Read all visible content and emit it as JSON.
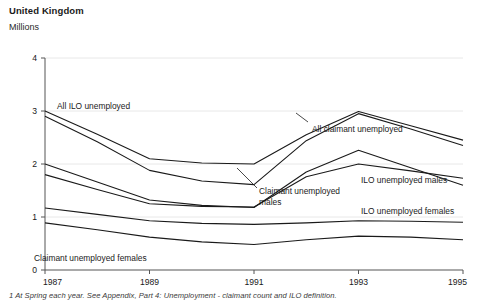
{
  "header": {
    "title": "United Kingdom",
    "unit": "Millions"
  },
  "footnote": "1 At Spring each year. See Appendix, Part 4: Unemployment - claimant count and ILO definition.",
  "axis": {
    "y_ticks": [
      "0",
      "1",
      "2",
      "3",
      "4"
    ],
    "x_ticks": [
      "1987",
      "1989",
      "1991",
      "1993",
      "1995"
    ]
  },
  "labels": {
    "all_ilo": "All ILO unemployed",
    "all_claimant": "All claimant unemployed",
    "ilo_males": "ILO unemployed males",
    "claimant_males_line1": "Claimant unemployed",
    "claimant_males_line2": "males",
    "ilo_females": "ILO unemployed females",
    "claimant_females": "Claimant unemployed females"
  },
  "colors": {
    "line": "#1a1a1a",
    "axis": "#555555",
    "grid": "#e8e8e8",
    "background": "#ffffff"
  },
  "chart_data": {
    "type": "line",
    "title": "United Kingdom",
    "subtitle": "Millions",
    "xlabel": "",
    "ylabel": "Millions",
    "x": [
      1987,
      1988,
      1989,
      1990,
      1991,
      1992,
      1993,
      1994,
      1995
    ],
    "xlim": [
      1987,
      1995
    ],
    "ylim": [
      0,
      4
    ],
    "y_ticks": [
      0,
      1,
      2,
      3,
      4
    ],
    "x_ticks": [
      1987,
      1989,
      1991,
      1993,
      1995
    ],
    "grid": true,
    "legend": "inline-annotations",
    "series": [
      {
        "name": "All ILO unemployed",
        "values": [
          3.0,
          2.56,
          2.1,
          2.02,
          2.0,
          2.55,
          2.99,
          2.72,
          2.45
        ]
      },
      {
        "name": "All claimant unemployed",
        "values": [
          2.9,
          2.42,
          1.88,
          1.68,
          1.61,
          2.44,
          2.95,
          2.66,
          2.35
        ]
      },
      {
        "name": "Claimant unemployed males",
        "values": [
          2.0,
          1.66,
          1.32,
          1.22,
          1.18,
          1.85,
          2.26,
          1.93,
          1.6
        ]
      },
      {
        "name": "ILO unemployed males",
        "values": [
          1.8,
          1.52,
          1.25,
          1.2,
          1.19,
          1.76,
          2.0,
          1.87,
          1.73
        ]
      },
      {
        "name": "ILO unemployed females",
        "values": [
          1.17,
          1.05,
          0.93,
          0.88,
          0.86,
          0.89,
          0.93,
          0.92,
          0.9
        ]
      },
      {
        "name": "Claimant unemployed females",
        "values": [
          0.89,
          0.76,
          0.62,
          0.53,
          0.48,
          0.57,
          0.64,
          0.62,
          0.57
        ]
      }
    ]
  }
}
